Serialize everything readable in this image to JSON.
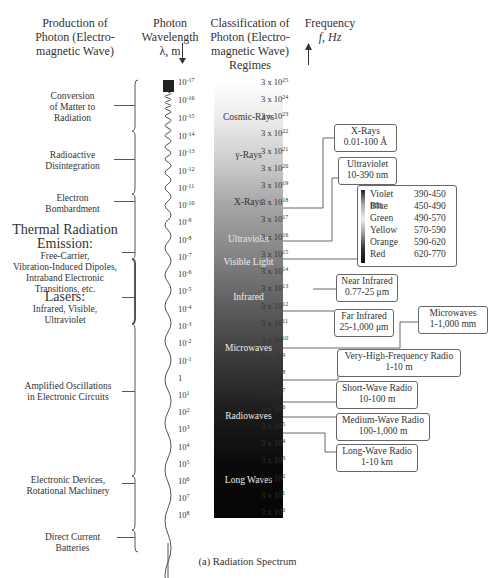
{
  "headers": {
    "production": [
      "Production of",
      "Photon (Electro-",
      "magnetic Wave)"
    ],
    "wavelength": [
      "Photon",
      "Wavelength",
      "λ, m"
    ],
    "classification": [
      "Classification of",
      "Photon (Electro-",
      "magnetic Wave)",
      "Regimes"
    ],
    "frequency": [
      "Frequency",
      "f, Hz"
    ]
  },
  "sources": [
    {
      "lines": [
        "Conversion",
        "of Matter to",
        "Radiation"
      ]
    },
    {
      "lines": [
        "Radioactive",
        "Disintegration"
      ]
    },
    {
      "lines": [
        "Electron",
        "Bombardment"
      ]
    },
    {
      "title": [
        "Thermal Radiation",
        "Emission:"
      ],
      "lines": [
        "Free-Carrier,",
        "Vibration-Induced Dipoles,",
        "Intraband Electronic",
        "Transitions, etc."
      ]
    },
    {
      "title": [
        "Lasers:"
      ],
      "lines": [
        "Infrared, Visible,",
        "Ultraviolet"
      ]
    },
    {
      "lines": [
        "Amplified Oscillations",
        "in Electronic Circuits"
      ]
    },
    {
      "lines": [
        "Electronic Devices,",
        "Rotational Machinery"
      ]
    },
    {
      "lines": [
        "Direct Current",
        "Batteries"
      ]
    }
  ],
  "wavelength_ticks": [
    {
      "base": "10",
      "exp": "-17"
    },
    {
      "base": "10",
      "exp": "-16"
    },
    {
      "base": "10",
      "exp": "-15"
    },
    {
      "base": "10",
      "exp": "-14"
    },
    {
      "base": "10",
      "exp": "-13"
    },
    {
      "base": "10",
      "exp": "-12"
    },
    {
      "base": "10",
      "exp": "-11"
    },
    {
      "base": "10",
      "exp": "-10"
    },
    {
      "base": "10",
      "exp": "-9"
    },
    {
      "base": "10",
      "exp": "-8"
    },
    {
      "base": "10",
      "exp": "-7"
    },
    {
      "base": "10",
      "exp": "-6"
    },
    {
      "base": "10",
      "exp": "-5"
    },
    {
      "base": "10",
      "exp": "-4"
    },
    {
      "base": "10",
      "exp": "-3"
    },
    {
      "base": "10",
      "exp": "-2"
    },
    {
      "base": "10",
      "exp": "-1"
    },
    {
      "base": "1",
      "exp": ""
    },
    {
      "base": "10",
      "exp": "1"
    },
    {
      "base": "10",
      "exp": "2"
    },
    {
      "base": "10",
      "exp": "3"
    },
    {
      "base": "10",
      "exp": "4"
    },
    {
      "base": "10",
      "exp": "5"
    },
    {
      "base": "10",
      "exp": "6"
    },
    {
      "base": "10",
      "exp": "7"
    },
    {
      "base": "10",
      "exp": "8"
    }
  ],
  "frequency_ticks": [
    {
      "base": "3 x 10",
      "exp": "25"
    },
    {
      "base": "3 x 10",
      "exp": "24"
    },
    {
      "base": "3 x 10",
      "exp": "23"
    },
    {
      "base": "3 x 10",
      "exp": "22"
    },
    {
      "base": "3 x 10",
      "exp": "21"
    },
    {
      "base": "3 x 10",
      "exp": "20"
    },
    {
      "base": "3 x 10",
      "exp": "19"
    },
    {
      "base": "3 x 10",
      "exp": "18"
    },
    {
      "base": "3 x 10",
      "exp": "17"
    },
    {
      "base": "3 x 10",
      "exp": "16"
    },
    {
      "base": "3 x 10",
      "exp": "15"
    },
    {
      "base": "3 x 10",
      "exp": "14"
    },
    {
      "base": "3 x 10",
      "exp": "13"
    },
    {
      "base": "3 x 10",
      "exp": "12"
    },
    {
      "base": "3 x 10",
      "exp": "11"
    },
    {
      "base": "3 x 10",
      "exp": "10"
    },
    {
      "base": "3 x 10",
      "exp": "9"
    },
    {
      "base": "3 x 10",
      "exp": "8"
    },
    {
      "base": "3 x 10",
      "exp": "7"
    },
    {
      "base": "3 x 10",
      "exp": "6"
    },
    {
      "base": "3 x 10",
      "exp": "5"
    },
    {
      "base": "3 x 10",
      "exp": "4"
    },
    {
      "base": "3 x 10",
      "exp": "3"
    },
    {
      "base": "3 x 10",
      "exp": "2"
    },
    {
      "base": "3 x 10",
      "exp": "1"
    },
    {
      "base": "3 x 10",
      "exp": "0"
    }
  ],
  "regimes": [
    {
      "label": "Cosmic-Rays",
      "color": "#333333"
    },
    {
      "label": "γ-Rays",
      "color": "#333333"
    },
    {
      "label": "X-Rays",
      "color": "#333333"
    },
    {
      "label": "Ultraviolet",
      "color": "#eeeeee"
    },
    {
      "label": "Visible Light",
      "color": "#eeeeee"
    },
    {
      "label": "Infrared",
      "color": "#eeeeee"
    },
    {
      "label": "Microwaves",
      "color": "#eeeeee"
    },
    {
      "label": "Radiowaves",
      "color": "#eeeeee"
    },
    {
      "label": "Long Waves",
      "color": "#eeeeee"
    }
  ],
  "ranges": {
    "xrays": {
      "name": "X-Rays",
      "range": "0.01-100 Å"
    },
    "ultraviolet": {
      "name": "Ultraviolet",
      "range": "10-390 nm"
    },
    "visible": [
      {
        "color": "Violet",
        "range": "390-450 nm"
      },
      {
        "color": "Blue",
        "range": "450-490"
      },
      {
        "color": "Green",
        "range": "490-570"
      },
      {
        "color": "Yellow",
        "range": "570-590"
      },
      {
        "color": "Orange",
        "range": "590-620"
      },
      {
        "color": "Red",
        "range": "620-770"
      }
    ],
    "near_infrared": {
      "name": "Near Infrared",
      "range": "0.77-25 μm"
    },
    "far_infrared": {
      "name": "Far Infrared",
      "range": "25-1,000 μm"
    },
    "microwaves": {
      "name": "Microwaves",
      "range": "1-1,000 mm"
    },
    "vhf": {
      "name": "Very-High-Frequency Radio",
      "range": "1-10 m"
    },
    "short_wave": {
      "name": "Short-Wave Radio",
      "range": "10-100 m"
    },
    "medium_wave": {
      "name": "Medium-Wave Radio",
      "range": "100-1,000 m"
    },
    "long_wave": {
      "name": "Long-Wave Radio",
      "range": "1-10 km"
    }
  },
  "caption": "(a) Radiation Spectrum"
}
